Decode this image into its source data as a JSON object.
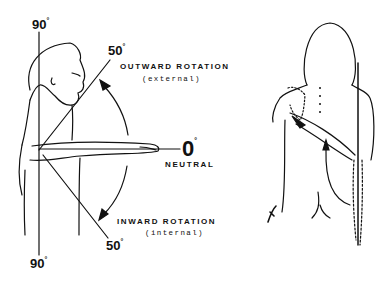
{
  "diagram": {
    "left_figure": {
      "labels": {
        "top_90": "90",
        "bottom_90": "90",
        "upper_50": "50",
        "lower_50": "50",
        "zero": "0",
        "degree_symbol": "°",
        "neutral": "NEUTRAL",
        "outward_title": "OUTWARD ROTATION",
        "outward_sub": "(external)",
        "inward_title": "INWARD ROTATION",
        "inward_sub": "(internal)"
      },
      "angles_deg": {
        "vertical_up": 90,
        "external": 50,
        "neutral": 0,
        "internal": 50,
        "vertical_down": 90
      }
    },
    "right_figure": {
      "description": "Posterior view showing internal rotation with hand behind back"
    },
    "colors": {
      "ink": "#111111",
      "background": "#ffffff"
    }
  }
}
